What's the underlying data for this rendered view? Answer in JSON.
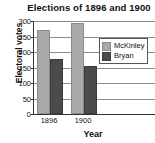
{
  "chart_data": {
    "type": "bar",
    "title": "Elections of 1896 and 1900",
    "xlabel": "Year",
    "ylabel": "Electoral votes",
    "categories": [
      "1896",
      "1900"
    ],
    "series": [
      {
        "name": "McKinley",
        "values": [
          271,
          292
        ],
        "color": "#a9a9a9"
      },
      {
        "name": "Bryan",
        "values": [
          176,
          155
        ],
        "color": "#4b4b4b"
      }
    ],
    "ylim": [
      0,
      300
    ],
    "yticks": [
      300,
      250,
      200,
      150,
      100,
      50,
      0
    ],
    "ytick_labels": [
      "300",
      "250",
      "200",
      "150",
      "100",
      "50",
      "0"
    ],
    "grid": true,
    "legend_position": "upper-right",
    "legend_entries": [
      "McKinley",
      "Bryan"
    ],
    "background": "#ffffff",
    "axis_color": "#333333",
    "grid_color": "#8d8d8d"
  }
}
